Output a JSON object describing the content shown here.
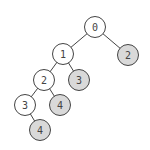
{
  "diagram": {
    "type": "binary-tree",
    "colors": {
      "white_fill": "#ffffff",
      "gray_fill": "#d9d9d9",
      "stroke": "#444444"
    },
    "nodes": [
      {
        "id": "n0",
        "label": "0",
        "x": 95,
        "y": 27,
        "fill": "white"
      },
      {
        "id": "n1",
        "label": "1",
        "x": 63,
        "y": 54,
        "fill": "white"
      },
      {
        "id": "n2r",
        "label": "2",
        "x": 128,
        "y": 55,
        "fill": "gray"
      },
      {
        "id": "n2",
        "label": "2",
        "x": 44,
        "y": 80,
        "fill": "white"
      },
      {
        "id": "n3r",
        "label": "3",
        "x": 79,
        "y": 80,
        "fill": "gray"
      },
      {
        "id": "n3",
        "label": "3",
        "x": 25,
        "y": 105,
        "fill": "white"
      },
      {
        "id": "n4r",
        "label": "4",
        "x": 60,
        "y": 105,
        "fill": "gray"
      },
      {
        "id": "n4",
        "label": "4",
        "x": 40,
        "y": 130,
        "fill": "gray"
      }
    ],
    "edges": [
      [
        "n0",
        "n1"
      ],
      [
        "n0",
        "n2r"
      ],
      [
        "n1",
        "n2"
      ],
      [
        "n1",
        "n3r"
      ],
      [
        "n2",
        "n3"
      ],
      [
        "n2",
        "n4r"
      ],
      [
        "n3",
        "n4"
      ]
    ]
  }
}
